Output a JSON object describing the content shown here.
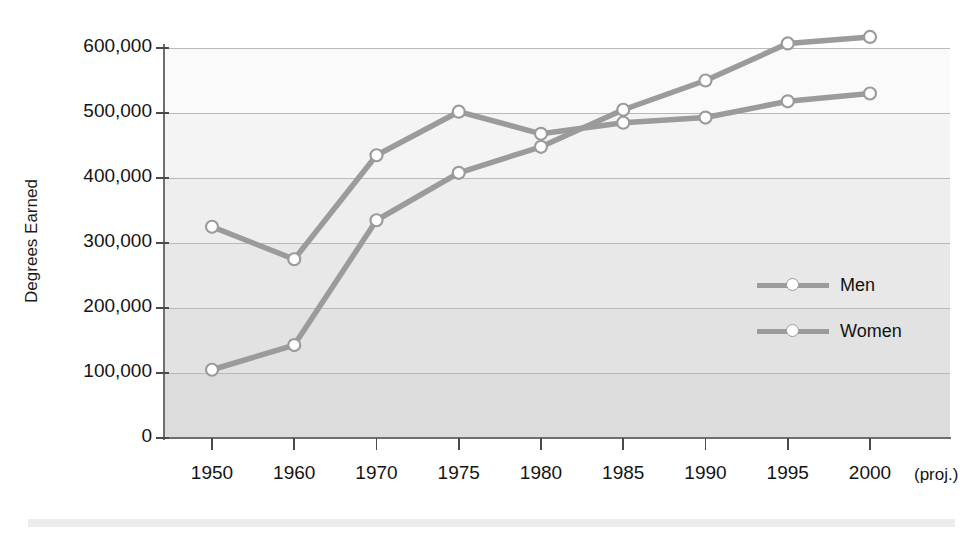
{
  "chart_data": {
    "type": "line",
    "title": "",
    "subtitle": "",
    "xlabel": "",
    "ylabel": "Degrees Earned",
    "x_note": "(proj.)",
    "categories": [
      "1950",
      "1960",
      "1970",
      "1975",
      "1980",
      "1985",
      "1990",
      "1995",
      "2000"
    ],
    "x_tick_labels": [
      "1950",
      "1960",
      "1970",
      "1975",
      "1980",
      "1985",
      "1990",
      "1995",
      "2000"
    ],
    "y_tick_labels": [
      "0",
      "100,000",
      "200,000",
      "300,000",
      "400,000",
      "500,000",
      "600,000"
    ],
    "y_ticks": [
      0,
      100000,
      200000,
      300000,
      400000,
      500000,
      600000
    ],
    "ylim": [
      0,
      600000
    ],
    "grid": "horizontal",
    "legend_position": "right-inside",
    "series": [
      {
        "name": "Men",
        "color": "#9b9b9b",
        "marker": "open-circle",
        "values": [
          325000,
          275000,
          435000,
          502000,
          468000,
          485000,
          493000,
          518000,
          530000
        ]
      },
      {
        "name": "Women",
        "color": "#9b9b9b",
        "marker": "open-circle",
        "values": [
          105000,
          143000,
          335000,
          408000,
          448000,
          505000,
          550000,
          607000,
          617000
        ]
      }
    ],
    "legend": [
      {
        "label": "Men"
      },
      {
        "label": "Women"
      }
    ],
    "colors": {
      "line": "#9b9b9b",
      "marker_fill": "#ffffff",
      "gridline": "#b9b9b9",
      "axis": "#6f6f6f",
      "text": "#141414",
      "bottom_rule": "#ececec"
    },
    "band_shades": [
      "#dcdcdc",
      "#e2e2e2",
      "#e8e8e8",
      "#eeeeee",
      "#f4f4f4",
      "#fafafa"
    ]
  }
}
